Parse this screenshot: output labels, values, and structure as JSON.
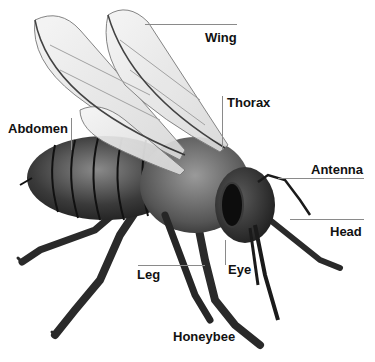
{
  "diagram": {
    "title": "Honeybee",
    "style": "grayscale pencil illustration",
    "colors": {
      "background": "#ffffff",
      "label_text": "#111111",
      "leader_line": "#8a8a8a",
      "body_dark": "#2a2a2a",
      "body_mid": "#6b6b6b",
      "wing_fill": "#e9e9e9"
    },
    "labels": [
      {
        "id": "wing",
        "text": "Wing"
      },
      {
        "id": "thorax",
        "text": "Thorax"
      },
      {
        "id": "abdomen",
        "text": "Abdomen"
      },
      {
        "id": "antenna",
        "text": "Antenna"
      },
      {
        "id": "head",
        "text": "Head"
      },
      {
        "id": "leg",
        "text": "Leg"
      },
      {
        "id": "eye",
        "text": "Eye"
      }
    ],
    "caption": "Honeybee"
  }
}
